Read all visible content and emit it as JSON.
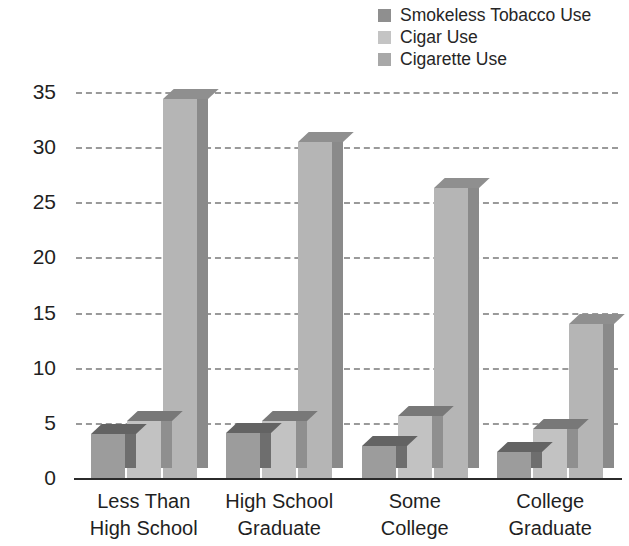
{
  "chart_data": {
    "type": "bar",
    "title": "",
    "subtitle": "",
    "xlabel": "",
    "ylabel": "Percent Use",
    "ylim": [
      0,
      35
    ],
    "yticks": [
      0,
      5,
      10,
      15,
      20,
      25,
      30,
      35
    ],
    "ytick_labels": [
      "0",
      "5",
      "10",
      "15",
      "20",
      "25",
      "30",
      "35"
    ],
    "grid": true,
    "grid_style": "dashed-horizontal",
    "legend_position": "top-right",
    "style": "3d-bars",
    "categories": [
      "Less Than High School",
      "High School Graduate",
      "Some College",
      "College Graduate"
    ],
    "category_lines": [
      [
        "Less Than",
        "High School"
      ],
      [
        "High School",
        "Graduate"
      ],
      [
        "Some",
        "College"
      ],
      [
        "College",
        "Graduate"
      ]
    ],
    "series": [
      {
        "name": "Smokeless Tobacco Use",
        "color": "#9c9c9c",
        "side_color": "#6e6e6e",
        "top_color": "#636363",
        "values": [
          4.0,
          4.1,
          2.9,
          2.4
        ]
      },
      {
        "name": "Cigar Use",
        "color": "#c2c2c2",
        "side_color": "#8f8f8f",
        "top_color": "#787878",
        "values": [
          5.2,
          5.2,
          5.6,
          4.4
        ]
      },
      {
        "name": "Cigarette Use",
        "color": "#b5b5b5",
        "side_color": "#8a8a8a",
        "top_color": "#8f8f8f",
        "values": [
          34.4,
          30.5,
          26.3,
          14.0
        ]
      }
    ]
  },
  "legend": {
    "items": [
      {
        "label": "Smokeless Tobacco Use",
        "swatch_color": "#8f8f8f"
      },
      {
        "label": "Cigar Use",
        "swatch_color": "#c4c4c4"
      },
      {
        "label": "Cigarette Use",
        "swatch_color": "#a8a8a8"
      }
    ]
  },
  "axis": {
    "y_title": "Percent Use"
  }
}
